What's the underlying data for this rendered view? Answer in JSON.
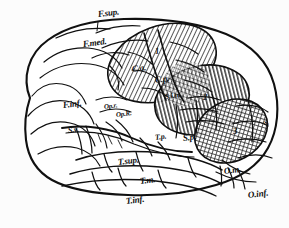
{
  "figure": {
    "background_color": "#fcfcfc",
    "ink_color": "#101010"
  },
  "labels": {
    "f_sup": "F.sup.",
    "f_med": "F.med.",
    "f_inf": "F.inf.",
    "op_r_upper": "Op.r.",
    "op_r_lower": "Op.R.",
    "s_v": "S.v.",
    "c_a": "C.a.",
    "c_p": "C.p.",
    "s_i_m": "S.i.m.",
    "t_p": "T.p.",
    "s_p": "S.p.",
    "t_sup": "T.sup.",
    "t_m": "T.m.",
    "t_inf": "T.inf.",
    "o_m": "O.m.",
    "o_inf": "O.inf.",
    "s_right": "S."
  },
  "zones": {
    "zone_1": {
      "number": "1",
      "pattern": "diagonal-hatch",
      "color": "#3a3a3a"
    },
    "zone_2": {
      "number": "2",
      "pattern": "vertical-hatch",
      "color": "#3a3a3a"
    },
    "zone_3": {
      "number": "3",
      "pattern": "cross-hatch",
      "color": "#2a2a2a"
    }
  }
}
